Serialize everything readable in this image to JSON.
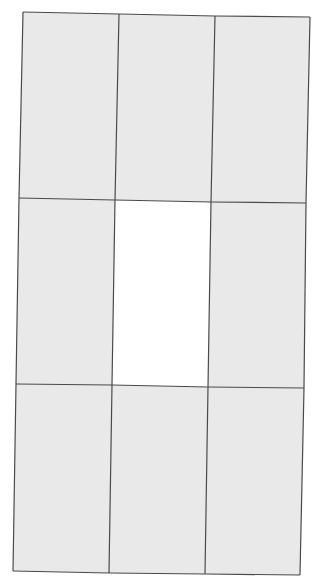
{
  "canvas": {
    "width": 322,
    "height": 588,
    "background": "#ffffff"
  },
  "grid": {
    "rows": 3,
    "cols": 3,
    "line_color": "#4a4a4a",
    "line_width": 1.2,
    "fill_color": "#e9e9e9",
    "empty_fill_color": "#ffffff",
    "points": [
      [
        [
          23,
          12
        ],
        [
          119,
          14
        ],
        [
          215,
          16
        ],
        [
          310,
          17
        ]
      ],
      [
        [
          19,
          198
        ],
        [
          115,
          200
        ],
        [
          211,
          202
        ],
        [
          306,
          203
        ]
      ],
      [
        [
          16,
          384
        ],
        [
          112,
          385
        ],
        [
          208,
          387
        ],
        [
          304,
          388
        ]
      ],
      [
        [
          13,
          571
        ],
        [
          109,
          573
        ],
        [
          205,
          574
        ],
        [
          300,
          575
        ]
      ]
    ],
    "cells": [
      {
        "row": 0,
        "col": 0,
        "state": "filled"
      },
      {
        "row": 0,
        "col": 1,
        "state": "filled"
      },
      {
        "row": 0,
        "col": 2,
        "state": "filled"
      },
      {
        "row": 1,
        "col": 0,
        "state": "filled"
      },
      {
        "row": 1,
        "col": 1,
        "state": "empty"
      },
      {
        "row": 1,
        "col": 2,
        "state": "filled"
      },
      {
        "row": 2,
        "col": 0,
        "state": "filled"
      },
      {
        "row": 2,
        "col": 1,
        "state": "filled"
      },
      {
        "row": 2,
        "col": 2,
        "state": "filled"
      }
    ]
  }
}
